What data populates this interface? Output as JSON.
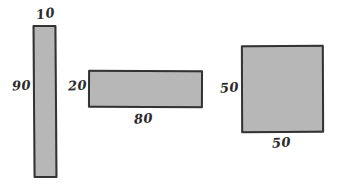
{
  "diagram": {
    "style": "hand-drawn sketch",
    "background_color": "#ffffff",
    "fill_color": "#b7b7b7",
    "stroke_color": "#363636",
    "text_color": "#2b2b2b",
    "shapes": [
      {
        "id": "tall",
        "name": "tall-narrow-rectangle",
        "width_label": "10",
        "height_label": "90",
        "width_label_position": "top",
        "height_label_position": "left"
      },
      {
        "id": "wide",
        "name": "wide-flat-rectangle",
        "width_label": "80",
        "height_label": "20",
        "width_label_position": "bottom",
        "height_label_position": "left"
      },
      {
        "id": "square",
        "name": "square",
        "width_label": "50",
        "height_label": "50",
        "width_label_position": "bottom",
        "height_label_position": "left"
      }
    ]
  }
}
